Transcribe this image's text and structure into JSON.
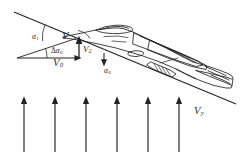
{
  "figure": {
    "background_color": "#ffffff",
    "line_color": "#222222",
    "label_color": "#2b2b2b"
  },
  "labels": {
    "alpha_1": {
      "base": "α",
      "sub": "1",
      "x": 32,
      "y": 33
    },
    "alpha_0": {
      "base": "α",
      "sub": "0",
      "x": 104,
      "y": 68
    },
    "delta_alpha_0": {
      "prefix": "Δ",
      "base": "α",
      "sub": "0",
      "x": 51,
      "y": 48
    },
    "V": {
      "base": "V",
      "sub": "",
      "x": 62,
      "y": 33
    },
    "V_0": {
      "base": "V",
      "sub": "0",
      "x": 54,
      "y": 59
    },
    "V_2_nose": {
      "base": "V",
      "sub": "2",
      "x": 84,
      "y": 47
    },
    "V_y_gust": {
      "base": "V",
      "sub": "y",
      "x": 194,
      "y": 108
    }
  },
  "gust_arrows": {
    "count": 6,
    "direction": "up",
    "tail_y": 152,
    "head_y": 97,
    "x_positions": [
      24,
      55,
      86,
      117,
      148,
      179
    ],
    "color": "#222222"
  },
  "flight_path": {
    "label": "trajectory line",
    "start": {
      "x": 14,
      "y": 12
    },
    "end": {
      "x": 236,
      "y": 104
    }
  },
  "vector_triangle": {
    "origin": {
      "x": 17,
      "y": 58
    },
    "horizontal_tip": {
      "x": 80,
      "y": 58
    },
    "resultant_tip": {
      "x": 80,
      "y": 38
    },
    "vertical_vector": {
      "from_y": 58,
      "to_y": 39
    }
  }
}
